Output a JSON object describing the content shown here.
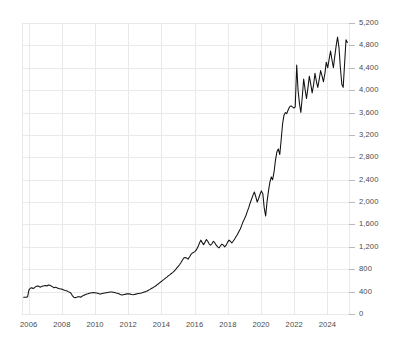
{
  "chart_data": {
    "type": "line",
    "title": "",
    "subtitle": "",
    "xlabel": "",
    "ylabel": "",
    "grid": true,
    "legend": false,
    "legend_position": "none",
    "line_color": "#111111",
    "grid_color": "#e9e9ec",
    "background_color": "#ffffff",
    "xlim": [
      2005.6,
      2025.3
    ],
    "ylim": [
      0,
      5200
    ],
    "x_ticks": [
      2006,
      2008,
      2010,
      2012,
      2014,
      2016,
      2018,
      2020,
      2022,
      2024
    ],
    "x_tick_labels": [
      "2006",
      "2008",
      "2010",
      "2012",
      "2014",
      "2016",
      "2018",
      "2020",
      "2022",
      "2024"
    ],
    "y_ticks": [
      0,
      400,
      800,
      1200,
      1600,
      2000,
      2400,
      2800,
      3200,
      3600,
      4000,
      4400,
      4800,
      5200
    ],
    "y_tick_labels": [
      "0",
      "400",
      "800",
      "1,200",
      "1,600",
      "2,000",
      "2,400",
      "2,800",
      "3,200",
      "3,600",
      "4,000",
      "4,400",
      "4,800",
      "5,200"
    ],
    "series": [
      {
        "name": "index-level",
        "x": [
          2005.7,
          2005.78,
          2005.86,
          2005.94,
          2006.02,
          2006.1,
          2006.18,
          2006.27,
          2006.35,
          2006.44,
          2006.52,
          2006.61,
          2006.69,
          2006.78,
          2006.86,
          2006.94,
          2007.02,
          2007.11,
          2007.19,
          2007.28,
          2007.36,
          2007.45,
          2007.53,
          2007.62,
          2007.7,
          2007.79,
          2007.87,
          2007.95,
          2008.04,
          2008.12,
          2008.21,
          2008.29,
          2008.38,
          2008.46,
          2008.55,
          2008.63,
          2008.72,
          2008.8,
          2008.89,
          2008.97,
          2009.06,
          2009.14,
          2009.23,
          2009.31,
          2009.4,
          2009.48,
          2009.57,
          2009.65,
          2009.74,
          2009.82,
          2009.91,
          2009.99,
          2010.08,
          2010.16,
          2010.25,
          2010.33,
          2010.42,
          2010.5,
          2010.59,
          2010.67,
          2010.76,
          2010.84,
          2010.93,
          2011.01,
          2011.1,
          2011.18,
          2011.27,
          2011.35,
          2011.44,
          2011.52,
          2011.61,
          2011.69,
          2011.78,
          2011.86,
          2011.95,
          2012.03,
          2012.12,
          2012.2,
          2012.29,
          2012.37,
          2012.46,
          2012.54,
          2012.63,
          2012.71,
          2012.8,
          2012.88,
          2012.97,
          2013.05,
          2013.14,
          2013.22,
          2013.31,
          2013.39,
          2013.48,
          2013.56,
          2013.65,
          2013.73,
          2013.82,
          2013.9,
          2013.99,
          2014.07,
          2014.16,
          2014.24,
          2014.33,
          2014.41,
          2014.5,
          2014.58,
          2014.67,
          2014.75,
          2014.84,
          2014.92,
          2015.01,
          2015.09,
          2015.18,
          2015.26,
          2015.35,
          2015.43,
          2015.52,
          2015.6,
          2015.69,
          2015.77,
          2015.86,
          2015.94,
          2016.03,
          2016.11,
          2016.2,
          2016.28,
          2016.37,
          2016.45,
          2016.54,
          2016.62,
          2016.71,
          2016.79,
          2016.88,
          2016.96,
          2017.05,
          2017.13,
          2017.22,
          2017.3,
          2017.39,
          2017.47,
          2017.56,
          2017.64,
          2017.73,
          2017.81,
          2017.9,
          2017.98,
          2018.07,
          2018.15,
          2018.24,
          2018.32,
          2018.41,
          2018.49,
          2018.58,
          2018.66,
          2018.75,
          2018.83,
          2018.92,
          2019.0,
          2019.09,
          2019.17,
          2019.26,
          2019.34,
          2019.43,
          2019.51,
          2019.6,
          2019.68,
          2019.77,
          2019.85,
          2019.94,
          2020.02,
          2020.11,
          2020.19,
          2020.28,
          2020.36,
          2020.45,
          2020.53,
          2020.62,
          2020.7,
          2020.79,
          2020.87,
          2020.96,
          2021.04,
          2021.13,
          2021.21,
          2021.3,
          2021.38,
          2021.47,
          2021.55,
          2021.64,
          2021.72,
          2021.81,
          2021.89,
          2021.98,
          2022.06,
          2022.15,
          2022.23,
          2022.32,
          2022.4,
          2022.49,
          2022.57,
          2022.66,
          2022.74,
          2022.83,
          2022.91,
          2023.0,
          2023.08,
          2023.17,
          2023.25,
          2023.34,
          2023.42,
          2023.51,
          2023.59,
          2023.68,
          2023.76,
          2023.85,
          2023.93,
          2024.02,
          2024.1,
          2024.19,
          2024.27,
          2024.36,
          2024.44,
          2024.53,
          2024.61,
          2024.7,
          2024.78,
          2024.87,
          2024.95,
          2025.04,
          2025.12,
          2025.2
        ],
        "values": [
          300,
          300,
          300,
          310,
          430,
          460,
          470,
          455,
          470,
          490,
          500,
          495,
          480,
          490,
          500,
          505,
          510,
          500,
          520,
          515,
          500,
          485,
          470,
          480,
          470,
          455,
          450,
          445,
          440,
          430,
          420,
          415,
          400,
          390,
          370,
          330,
          300,
          290,
          300,
          310,
          310,
          300,
          320,
          330,
          345,
          355,
          360,
          370,
          375,
          380,
          385,
          380,
          375,
          370,
          360,
          355,
          365,
          370,
          375,
          380,
          385,
          390,
          395,
          395,
          390,
          385,
          375,
          370,
          360,
          350,
          340,
          345,
          350,
          355,
          360,
          360,
          355,
          350,
          345,
          350,
          355,
          360,
          365,
          370,
          375,
          385,
          395,
          400,
          410,
          425,
          440,
          455,
          470,
          485,
          500,
          520,
          540,
          560,
          580,
          600,
          620,
          640,
          660,
          680,
          700,
          720,
          740,
          760,
          790,
          820,
          850,
          880,
          920,
          960,
          1000,
          1010,
          1000,
          980,
          1020,
          1060,
          1090,
          1100,
          1120,
          1150,
          1200,
          1260,
          1320,
          1280,
          1240,
          1280,
          1330,
          1300,
          1250,
          1230,
          1260,
          1300,
          1270,
          1230,
          1200,
          1180,
          1220,
          1250,
          1230,
          1200,
          1230,
          1280,
          1320,
          1300,
          1270,
          1300,
          1340,
          1380,
          1420,
          1470,
          1520,
          1580,
          1650,
          1700,
          1760,
          1830,
          1900,
          1980,
          2050,
          2120,
          2180,
          2100,
          2000,
          2060,
          2140,
          2200,
          2150,
          1900,
          1750,
          2000,
          2200,
          2350,
          2450,
          2400,
          2550,
          2750,
          2900,
          2950,
          2850,
          3100,
          3400,
          3550,
          3600,
          3580,
          3650,
          3700,
          3720,
          3700,
          3680,
          3700,
          4450,
          4000,
          3750,
          3600,
          3900,
          4200,
          4000,
          3850,
          4050,
          4250,
          4100,
          3950,
          4100,
          4300,
          4150,
          4050,
          4200,
          4350,
          4250,
          4150,
          4300,
          4500,
          4400,
          4550,
          4700,
          4550,
          4400,
          4600,
          4800,
          4950,
          4750,
          4400,
          4100,
          4050,
          4500,
          4900,
          4850
        ]
      }
    ]
  },
  "axes": {
    "y_axis_name": "y-axis",
    "x_axis_name": "x-axis"
  }
}
